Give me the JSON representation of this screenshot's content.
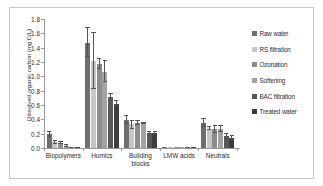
{
  "chart_data": {
    "type": "bar",
    "title": "",
    "subtitle": "",
    "xlabel": "",
    "ylabel": "Dissolved organic carbon (mg C/L)",
    "ylim": [
      0.0,
      1.8
    ],
    "ytick_labels": [
      "0.0",
      "0.2",
      "0.4",
      "0.6",
      "0.8",
      "1.0",
      "1.2",
      "1.4",
      "1.6",
      "1.8"
    ],
    "ytick_values": [
      0.0,
      0.2,
      0.4,
      0.6,
      0.8,
      1.0,
      1.2,
      1.4,
      1.6,
      1.8
    ],
    "grid": false,
    "legend_position": "right",
    "categories": [
      "Biopolymers",
      "Humics",
      "Building blocks",
      "LMW acids",
      "Neutrals"
    ],
    "category_labels_display": [
      "Biopolymers",
      "Humics",
      "Building\nblocks",
      "LMW acids",
      "Neutrals"
    ],
    "series": [
      {
        "name": "Raw water",
        "color": "#6e6e6e",
        "values": [
          0.19,
          1.47,
          0.39,
          0.01,
          0.35
        ],
        "err_low": [
          0.04,
          0.2,
          0.05,
          0.005,
          0.06
        ],
        "err_high": [
          0.04,
          0.2,
          0.05,
          0.005,
          0.06
        ]
      },
      {
        "name": "RS filtration",
        "color": "#c6c6c6",
        "values": [
          0.08,
          1.21,
          0.33,
          0.01,
          0.27
        ],
        "err_low": [
          0.02,
          0.38,
          0.07,
          0.005,
          0.02
        ],
        "err_high": [
          0.02,
          0.39,
          0.05,
          0.005,
          0.02
        ]
      },
      {
        "name": "Ozonation",
        "color": "#8c8c8c",
        "values": [
          0.07,
          1.17,
          0.35,
          0.01,
          0.26
        ],
        "err_low": [
          0.02,
          0.07,
          0.03,
          0.005,
          0.05
        ],
        "err_high": [
          0.02,
          0.07,
          0.03,
          0.005,
          0.05
        ]
      },
      {
        "name": "Softening",
        "color": "#a3a3a3",
        "values": [
          0.03,
          1.06,
          0.34,
          0.01,
          0.27
        ],
        "err_low": [
          0.01,
          0.14,
          0.01,
          0.005,
          0.04
        ],
        "err_high": [
          0.01,
          0.15,
          0.01,
          0.005,
          0.04
        ]
      },
      {
        "name": "BAC filtration",
        "color": "#585858",
        "values": [
          0.01,
          0.71,
          0.21,
          0.005,
          0.17
        ],
        "err_low": [
          0.005,
          0.05,
          0.02,
          0.003,
          0.03
        ],
        "err_high": [
          0.005,
          0.05,
          0.02,
          0.003,
          0.03
        ]
      },
      {
        "name": "Treated water",
        "color": "#3d3d3d",
        "values": [
          0.01,
          0.62,
          0.21,
          0.005,
          0.14
        ],
        "err_low": [
          0.005,
          0.04,
          0.02,
          0.003,
          0.03
        ],
        "err_high": [
          0.005,
          0.04,
          0.02,
          0.003,
          0.03
        ]
      }
    ]
  },
  "legend": {
    "items": [
      {
        "label": "Raw water",
        "color": "#6e6e6e"
      },
      {
        "label": "RS filtration",
        "color": "#c6c6c6"
      },
      {
        "label": "Ozonation",
        "color": "#8c8c8c"
      },
      {
        "label": "Softening",
        "color": "#a3a3a3"
      },
      {
        "label": "BAC filtration",
        "color": "#585858"
      },
      {
        "label": "Treated water",
        "color": "#3d3d3d"
      }
    ]
  },
  "axes": {
    "y_title": "Dissolved organic carbon (mg C/L)"
  }
}
